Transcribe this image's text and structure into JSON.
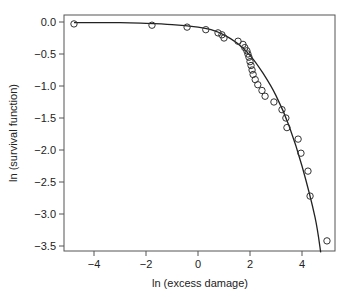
{
  "chart_data": {
    "type": "scatter",
    "title": "",
    "xlabel": "ln (excess damage)",
    "ylabel": "ln (survival function)",
    "xlim": [
      -5.2,
      5.3
    ],
    "ylim": [
      -3.6,
      0.1
    ],
    "x_ticks": [
      -4,
      -2,
      0,
      2,
      4
    ],
    "x_tick_labels": [
      "−4",
      "−2",
      "0",
      "2",
      "4"
    ],
    "y_ticks": [
      0.0,
      -0.5,
      -1.0,
      -1.5,
      -2.0,
      -2.5,
      -3.0,
      -3.5
    ],
    "y_tick_labels": [
      "0.0",
      "−0.5",
      "−1.0",
      "−1.5",
      "−2.0",
      "−2.5",
      "−3.0",
      "−3.5"
    ],
    "grid": false,
    "legend": null,
    "series": [
      {
        "name": "observed",
        "marker": "open-circle",
        "x": [
          -4.77,
          -1.77,
          -0.42,
          0.3,
          0.77,
          0.92,
          1.0,
          1.54,
          1.73,
          1.8,
          1.88,
          1.92,
          1.96,
          2.0,
          2.04,
          2.08,
          2.12,
          2.2,
          2.3,
          2.46,
          2.58,
          2.92,
          3.23,
          3.38,
          3.42,
          3.85,
          3.96,
          4.23,
          4.31,
          4.96
        ],
        "y": [
          -0.03,
          -0.05,
          -0.08,
          -0.12,
          -0.17,
          -0.2,
          -0.25,
          -0.3,
          -0.35,
          -0.4,
          -0.45,
          -0.5,
          -0.55,
          -0.62,
          -0.68,
          -0.75,
          -0.82,
          -0.9,
          -0.98,
          -1.07,
          -1.16,
          -1.25,
          -1.37,
          -1.5,
          -1.65,
          -1.83,
          -2.05,
          -2.33,
          -2.72,
          -3.42
        ]
      },
      {
        "name": "fitted",
        "style": "line",
        "x": [
          -4.77,
          -3,
          -2,
          -1,
          0,
          0.5,
          1,
          1.5,
          2,
          2.5,
          3,
          3.5,
          4,
          4.5,
          4.72
        ],
        "y": [
          -0.01,
          -0.01,
          -0.02,
          -0.04,
          -0.08,
          -0.12,
          -0.2,
          -0.33,
          -0.52,
          -0.8,
          -1.15,
          -1.62,
          -2.25,
          -3.05,
          -3.6
        ]
      }
    ]
  }
}
